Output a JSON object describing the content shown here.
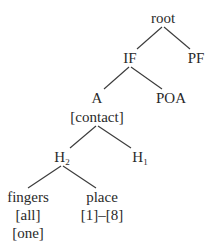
{
  "diagram": {
    "type": "tree",
    "nodes": {
      "root": {
        "label": "root"
      },
      "if": {
        "label": "IF"
      },
      "pf": {
        "label": "PF"
      },
      "a": {
        "label": "A"
      },
      "contact": {
        "label": "[contact]"
      },
      "poa": {
        "label": "POA"
      },
      "h2": {
        "label": "H",
        "sub": "2"
      },
      "h1": {
        "label": "H",
        "sub": "1"
      },
      "fingers": {
        "label": "fingers"
      },
      "all": {
        "label": "[all]"
      },
      "one": {
        "label": "[one]"
      },
      "place": {
        "label": "place"
      },
      "range": {
        "label": "[1]–[8]"
      }
    },
    "edges": [
      [
        "root",
        "IF"
      ],
      [
        "root",
        "PF"
      ],
      [
        "IF",
        "A"
      ],
      [
        "IF",
        "POA"
      ],
      [
        "A [contact]",
        "H2"
      ],
      [
        "A [contact]",
        "H1"
      ],
      [
        "H2",
        "fingers"
      ],
      [
        "H2",
        "place"
      ]
    ]
  }
}
